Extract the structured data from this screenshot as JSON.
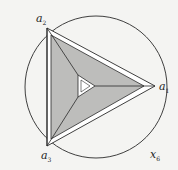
{
  "diagram": {
    "colors": {
      "background": "#f4f4f2",
      "stroke": "#2a2a2a",
      "shade": "#bdbdbb",
      "inner": "#ffffff"
    },
    "labels": {
      "a1": {
        "base": "a",
        "sub": "1"
      },
      "a2": {
        "base": "a",
        "sub": "2"
      },
      "a3": {
        "base": "a",
        "sub": "3"
      },
      "x6": {
        "base": "x",
        "sub": "6"
      }
    }
  }
}
